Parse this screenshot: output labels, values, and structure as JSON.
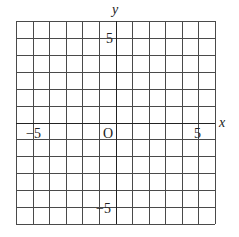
{
  "chart_data": {
    "type": "scatter",
    "title": "",
    "xlabel": "x",
    "ylabel": "y",
    "xlim": [
      -6,
      6
    ],
    "ylim": [
      -6,
      6
    ],
    "grid": true,
    "grid_step": 1,
    "origin_label": "O",
    "x_tick_labels": [
      {
        "value": -5,
        "label": "−5"
      },
      {
        "value": 5,
        "label": "5"
      }
    ],
    "y_tick_labels": [
      {
        "value": 5,
        "label": "5"
      },
      {
        "value": -5,
        "label": "−5"
      }
    ],
    "series": [],
    "colors": {
      "grid": "#4a4a4a",
      "axis": "#222222",
      "text": "#222222"
    }
  },
  "labels": {
    "x_axis": "x",
    "y_axis": "y",
    "origin": "O",
    "x_neg5": "−5",
    "x_pos5": "5",
    "y_pos5": "5",
    "y_neg5": "−5"
  }
}
